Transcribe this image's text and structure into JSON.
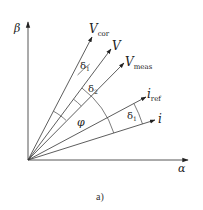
{
  "diagram": {
    "caption": "a)",
    "axes": {
      "vertical": "β",
      "horizontal": "α"
    },
    "vectors": [
      {
        "id": "v_cor",
        "label": "V",
        "subscript": "cor"
      },
      {
        "id": "v",
        "label": "V",
        "subscript": ""
      },
      {
        "id": "v_meas",
        "label": "V",
        "subscript": "meas"
      },
      {
        "id": "i_ref",
        "label": "i",
        "subscript": "ref"
      },
      {
        "id": "i",
        "label": "i",
        "subscript": ""
      }
    ],
    "angles": [
      {
        "id": "delta1_top",
        "label": "δ",
        "subscript": "1",
        "between": [
          "v",
          "v_cor"
        ]
      },
      {
        "id": "delta2",
        "label": "δ",
        "subscript": "2",
        "between": [
          "v_meas",
          "v"
        ]
      },
      {
        "id": "phi",
        "label": "φ",
        "subscript": "",
        "between": [
          "i",
          "v"
        ]
      },
      {
        "id": "delta1_bottom",
        "label": "δ",
        "subscript": "1",
        "between": [
          "i",
          "i_ref"
        ]
      }
    ],
    "colors": {
      "line": "#333333",
      "text": "#222222"
    }
  }
}
